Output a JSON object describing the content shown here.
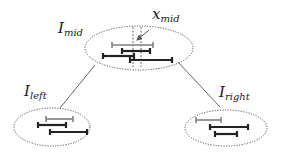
{
  "labels": {
    "mid": {
      "main": "I",
      "sub": "mid"
    },
    "left": {
      "main": "I",
      "sub": "left"
    },
    "right": {
      "main": "I",
      "sub": "right"
    },
    "center": {
      "main": "x",
      "sub": "mid"
    }
  },
  "colors": {
    "dark_interval": "#222222",
    "light_interval": "#808080",
    "ellipse_border": "#555555",
    "connector": "#666666"
  },
  "nodes": {
    "mid": {
      "ellipse": {
        "cx": 139,
        "cy": 48,
        "rx": 54,
        "ry": 22
      },
      "intervals": [
        {
          "x1": 112,
          "x2": 153,
          "y": 45,
          "shade": "light"
        },
        {
          "x1": 122,
          "x2": 150,
          "y": 51,
          "shade": "dark"
        },
        {
          "x1": 103,
          "x2": 134,
          "y": 56,
          "shade": "dark"
        },
        {
          "x1": 130,
          "x2": 172,
          "y": 60,
          "shade": "dark"
        }
      ],
      "dashed_lines": [
        {
          "x": 133,
          "y1": 27,
          "y2": 67
        },
        {
          "x": 141,
          "y1": 27,
          "y2": 67
        }
      ]
    },
    "left": {
      "ellipse": {
        "cx": 52,
        "cy": 127,
        "rx": 38,
        "ry": 19
      },
      "intervals": [
        {
          "x1": 46,
          "x2": 73,
          "y": 119,
          "shade": "light"
        },
        {
          "x1": 38,
          "x2": 66,
          "y": 125,
          "shade": "dark"
        },
        {
          "x1": 50,
          "x2": 87,
          "y": 132,
          "shade": "dark"
        }
      ]
    },
    "right": {
      "ellipse": {
        "cx": 226,
        "cy": 128,
        "rx": 41,
        "ry": 18
      },
      "intervals": [
        {
          "x1": 196,
          "x2": 221,
          "y": 120,
          "shade": "light"
        },
        {
          "x1": 210,
          "x2": 248,
          "y": 127,
          "shade": "dark"
        },
        {
          "x1": 215,
          "x2": 237,
          "y": 134,
          "shade": "dark"
        }
      ]
    }
  },
  "edges": [
    {
      "from": "mid",
      "to": "left",
      "x1": 95,
      "y1": 65,
      "x2": 60,
      "y2": 108
    },
    {
      "from": "mid",
      "to": "right",
      "x1": 178,
      "y1": 62,
      "x2": 220,
      "y2": 107
    }
  ],
  "pointer": {
    "x1": 149,
    "y1": 30,
    "x2": 137,
    "y2": 40
  }
}
